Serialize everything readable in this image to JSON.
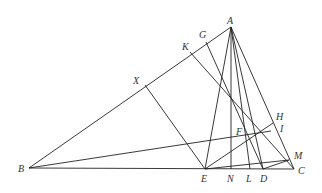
{
  "diagram": {
    "type": "geometry-triangle",
    "points": {
      "A": [
        231,
        27
      ],
      "B": [
        29,
        168
      ],
      "C": [
        294,
        169
      ],
      "D": [
        263,
        169
      ],
      "E": [
        205,
        169
      ],
      "L": [
        250,
        169
      ],
      "N": [
        231,
        169
      ],
      "F": [
        251,
        137
      ],
      "G": [
        206,
        42
      ],
      "K": [
        190,
        52
      ],
      "X": [
        145,
        85
      ],
      "H": [
        273,
        123
      ],
      "I": [
        271,
        131
      ],
      "M": [
        289,
        160
      ]
    },
    "labels": [
      {
        "text": "A",
        "x": 227,
        "y": 24
      },
      {
        "text": "B",
        "x": 18,
        "y": 172
      },
      {
        "text": "C",
        "x": 298,
        "y": 174
      },
      {
        "text": "D",
        "x": 260,
        "y": 182
      },
      {
        "text": "E",
        "x": 201,
        "y": 182
      },
      {
        "text": "L",
        "x": 246,
        "y": 182
      },
      {
        "text": "N",
        "x": 227,
        "y": 182
      },
      {
        "text": "F",
        "x": 236,
        "y": 135
      },
      {
        "text": "G",
        "x": 199,
        "y": 38
      },
      {
        "text": "K",
        "x": 182,
        "y": 50
      },
      {
        "text": "X",
        "x": 133,
        "y": 84
      },
      {
        "text": "H",
        "x": 276,
        "y": 120
      },
      {
        "text": "I",
        "x": 280,
        "y": 132
      },
      {
        "text": "M",
        "x": 294,
        "y": 159
      }
    ]
  }
}
